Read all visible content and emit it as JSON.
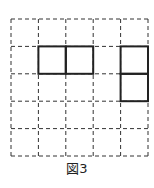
{
  "caption": "図3",
  "grid": {
    "rows": 5,
    "cols": 5,
    "left": 11,
    "top": 19,
    "cell": 27.4,
    "dash_color": "#333333",
    "solid_color": "#222222"
  },
  "shapes": [
    {
      "name": "horizontal-domino",
      "cells": [
        [
          1,
          1
        ],
        [
          1,
          2
        ]
      ]
    },
    {
      "name": "vertical-domino",
      "cells": [
        [
          1,
          4
        ],
        [
          2,
          4
        ]
      ]
    }
  ]
}
